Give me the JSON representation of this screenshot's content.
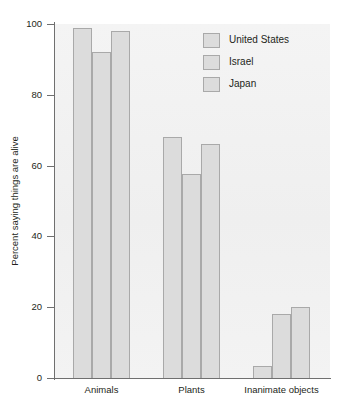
{
  "chart_data": {
    "type": "bar",
    "title": "",
    "xlabel": "",
    "ylabel": "Percent saying things are alive",
    "categories": [
      "Animals",
      "Plants",
      "Inanimate objects"
    ],
    "series": [
      {
        "name": "United States",
        "values": [
          99,
          68,
          3.5
        ],
        "color": "#dcdcdc"
      },
      {
        "name": "Israel",
        "values": [
          92,
          57.5,
          18
        ],
        "color": "#dcdcdc"
      },
      {
        "name": "Japan",
        "values": [
          98,
          66,
          20
        ],
        "color": "#dcdcdc"
      }
    ],
    "ylim": [
      0,
      100
    ],
    "yticks": [
      0,
      20,
      40,
      60,
      80,
      100
    ],
    "ytick_labels": [
      "0",
      "20",
      "40",
      "60",
      "80",
      "100"
    ],
    "grid": false,
    "legend_position": "top-right",
    "legend_entries": [
      "United States",
      "Israel",
      "Japan"
    ],
    "bar_fill_color": "#dcdcdc",
    "bar_edge_color": "#a9a9a9",
    "plot_background_color": "#f2f2f2",
    "axis_color": "#6f6f6f"
  }
}
